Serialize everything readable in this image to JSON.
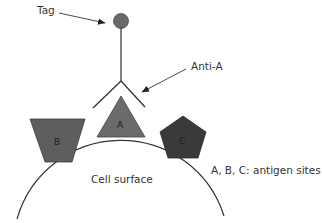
{
  "labels": {
    "tag": "Tag",
    "antibody": "Anti-A",
    "legend": "A, B, C: antigen sites",
    "cell": "Cell surface"
  },
  "antigens": [
    {
      "id": "A",
      "label": "A",
      "shape": "triangle",
      "color": "#6b6b6b"
    },
    {
      "id": "B",
      "label": "B",
      "shape": "trapezoid",
      "color": "#5e5e5e"
    },
    {
      "id": "C",
      "label": "C",
      "shape": "pentagon",
      "color": "#3a3a3a"
    }
  ],
  "colors": {
    "tag": "#6a6a6a",
    "line": "#333333",
    "background": "#ffffff"
  }
}
